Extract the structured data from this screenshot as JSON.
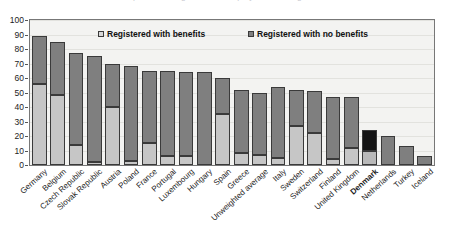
{
  "figure": {
    "title_remnant": "Proportion of registered unemployed receiving benefits",
    "background": "#f3f3f1",
    "frame_color": "#777777"
  },
  "legend": {
    "position": "inside-top",
    "entries": [
      {
        "label": "Registered with benefits",
        "color": "#d8d8d8",
        "swatch": "light-square-swatch"
      },
      {
        "label": "Registered with no benefits",
        "color": "#7f7f7f",
        "swatch": "dark-square-swatch"
      }
    ]
  },
  "yaxis": {
    "ticks": [
      "100",
      "90",
      "80",
      "70",
      "60",
      "50",
      "40",
      "30",
      "20",
      "10",
      "0"
    ],
    "min": 0,
    "max": 100,
    "step": 10
  },
  "highlight": {
    "category": "Denmark",
    "color": "#141414",
    "style": "bold-label"
  },
  "chart_data": {
    "type": "bar",
    "subtype": "stacked-column",
    "title": "Proportion of registered unemployed receiving benefits",
    "xlabel": "",
    "ylabel": "",
    "ylim": [
      0,
      100
    ],
    "ytick_step": 10,
    "grid": true,
    "legend_position": "inside-top",
    "categories": [
      "Germany",
      "Belgium",
      "Czech Republic",
      "Slovak Republic",
      "Austria",
      "Poland",
      "France",
      "Portugal",
      "Luxembourg",
      "Hungary",
      "Spain",
      "Greece",
      "Unweighted average",
      "Italy",
      "Sweden",
      "Switzerland",
      "Finland",
      "United Kingdom",
      "Denmark",
      "Netherlands",
      "Turkey",
      "Iceland"
    ],
    "series": [
      {
        "name": "Registered with benefits",
        "color": "#c6c6c6",
        "values": [
          56,
          48,
          14,
          2,
          40,
          3,
          15,
          6,
          6,
          0,
          35,
          8,
          7,
          5,
          27,
          22,
          4,
          12,
          10,
          0,
          0,
          0
        ]
      },
      {
        "name": "Registered with no benefits",
        "color": "#7f7f7f",
        "values": [
          33,
          37,
          63,
          73,
          30,
          65,
          50,
          59,
          58,
          64,
          25,
          44,
          43,
          49,
          25,
          29,
          43,
          35,
          14,
          20,
          13,
          6
        ]
      }
    ],
    "totals": [
      89,
      85,
      77,
      75,
      70,
      68,
      65,
      65,
      64,
      64,
      60,
      52,
      50,
      54,
      52,
      51,
      47,
      47,
      24,
      20,
      13,
      6
    ]
  }
}
